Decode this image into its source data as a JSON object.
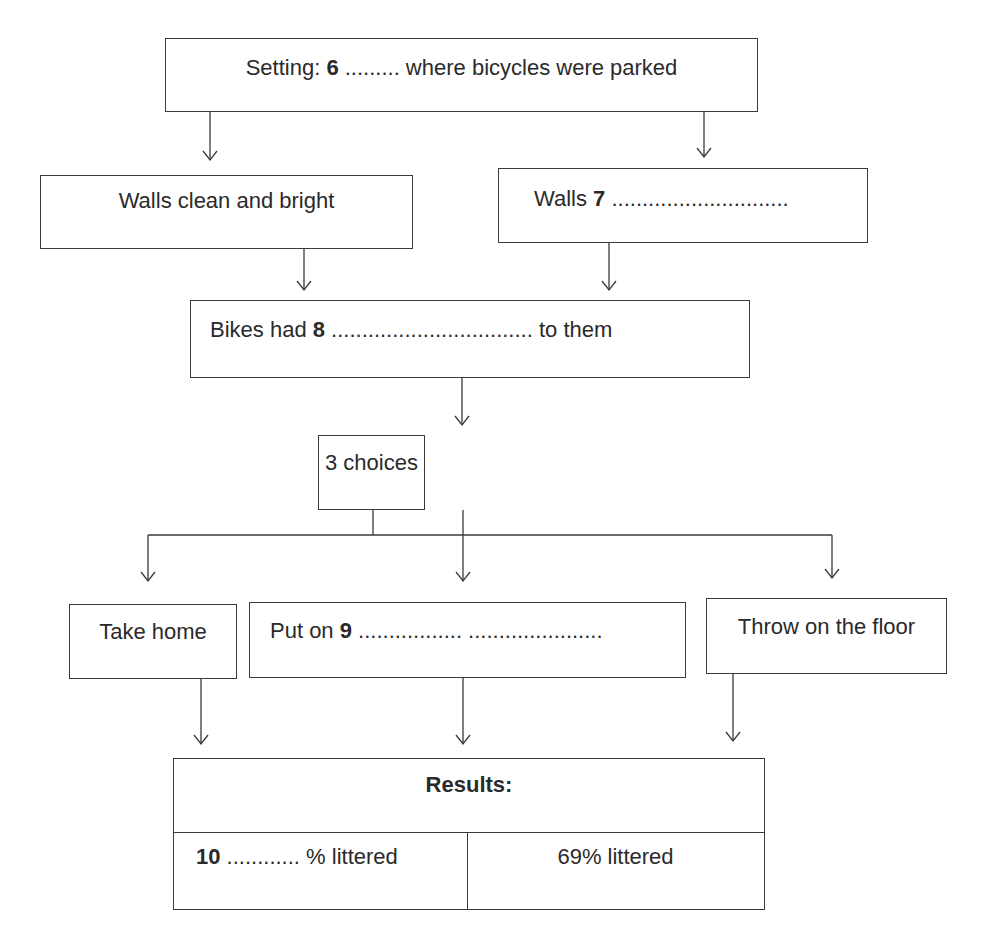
{
  "diagram": {
    "setting": {
      "prefix": "Setting: ",
      "number": "6",
      "blank": " .........",
      "suffix": " where bicycles were parked"
    },
    "walls_clean": {
      "label": "Walls clean and bright"
    },
    "walls_other": {
      "prefix": "Walls ",
      "number": "7",
      "blank": " ............................."
    },
    "bikes": {
      "prefix": "Bikes had ",
      "number": "8",
      "blank": " .................................",
      "suffix": " to them"
    },
    "choices": {
      "label": "3 choices"
    },
    "options": [
      {
        "label": "Take home"
      },
      {
        "prefix": "Put on ",
        "number": "9",
        "blank": " ................. ......................"
      },
      {
        "label": "Throw on the floor"
      }
    ],
    "results": {
      "title": "Results:",
      "left": {
        "number": "10",
        "blank": " ............",
        "suffix": " % littered"
      },
      "right": {
        "label": "69% littered"
      }
    }
  }
}
